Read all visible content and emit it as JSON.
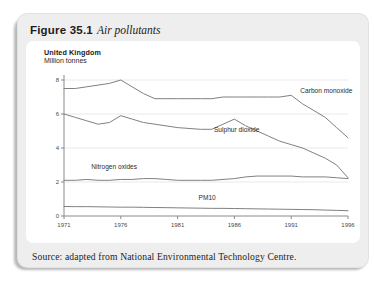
{
  "figure": {
    "label": "Figure 35.1",
    "caption": "Air pollutants"
  },
  "chart_header": {
    "country": "United Kingdom",
    "units": "Million tonnes"
  },
  "source": {
    "text": "Source: adapted from National Environmental Technology Centre."
  },
  "colors": {
    "card_background": "#eeeeee",
    "panel_background": "#ffffff",
    "line": "#808080",
    "axis": "#8a8a8a",
    "gridline": "#e9e9e9",
    "text": "#1c1c1c"
  },
  "chart_data": {
    "type": "line",
    "title": "Air pollutants",
    "subtitle": "United Kingdom, Million tonnes",
    "xlabel": "",
    "ylabel": "Million tonnes",
    "xlim": [
      1971,
      1996
    ],
    "ylim": [
      0,
      8
    ],
    "yticks": [
      0,
      2,
      4,
      6,
      8
    ],
    "ytick_labels": [
      "0",
      "2",
      "4",
      "6",
      "8"
    ],
    "xticks": [
      1971,
      1976,
      1981,
      1986,
      1991,
      1996
    ],
    "xtick_labels": [
      "1971",
      "1976",
      "1981",
      "1986",
      "1991",
      "1996"
    ],
    "grid": true,
    "legend": "inline-labels",
    "x": [
      1971,
      1972,
      1973,
      1974,
      1975,
      1976,
      1977,
      1978,
      1979,
      1980,
      1981,
      1982,
      1983,
      1984,
      1985,
      1986,
      1987,
      1988,
      1989,
      1990,
      1991,
      1992,
      1993,
      1994,
      1995,
      1996
    ],
    "series": [
      {
        "name": "Carbon monoxide",
        "label": "Carbon monoxide",
        "values": [
          7.5,
          7.5,
          7.6,
          7.7,
          7.8,
          8.0,
          7.6,
          7.2,
          6.9,
          6.9,
          6.9,
          6.9,
          6.9,
          6.9,
          7.0,
          7.0,
          7.0,
          7.0,
          7.0,
          7.0,
          7.1,
          6.6,
          6.2,
          5.8,
          5.2,
          4.6
        ]
      },
      {
        "name": "Sulphur dioxide",
        "label": "Sulphur dioxide",
        "values": [
          6.0,
          5.8,
          5.6,
          5.4,
          5.5,
          5.9,
          5.7,
          5.5,
          5.4,
          5.3,
          5.2,
          5.15,
          5.1,
          5.1,
          5.4,
          5.7,
          5.3,
          5.0,
          4.7,
          4.4,
          4.2,
          4.0,
          3.7,
          3.4,
          3.0,
          2.25
        ]
      },
      {
        "name": "Nitrogen oxides",
        "label": "Nitrogen oxides",
        "values": [
          2.1,
          2.1,
          2.15,
          2.1,
          2.1,
          2.15,
          2.15,
          2.2,
          2.2,
          2.15,
          2.1,
          2.1,
          2.1,
          2.1,
          2.15,
          2.2,
          2.3,
          2.35,
          2.35,
          2.35,
          2.35,
          2.3,
          2.3,
          2.3,
          2.25,
          2.2
        ]
      },
      {
        "name": "PM10",
        "label": "PM10",
        "values": [
          0.56,
          0.55,
          0.55,
          0.54,
          0.53,
          0.52,
          0.52,
          0.51,
          0.5,
          0.49,
          0.48,
          0.47,
          0.46,
          0.45,
          0.45,
          0.44,
          0.43,
          0.42,
          0.41,
          0.4,
          0.39,
          0.38,
          0.37,
          0.35,
          0.33,
          0.31
        ]
      }
    ],
    "annotations": [
      {
        "text": "Carbon monoxide",
        "x": 1991.8,
        "y": 7.25
      },
      {
        "text": "Sulphur dioxide",
        "x": 1984.2,
        "y": 4.95
      },
      {
        "text": "Nitrogen oxides",
        "x": 1973.4,
        "y": 2.75
      },
      {
        "text": "PM10",
        "x": 1983.6,
        "y": 0.95
      }
    ]
  }
}
